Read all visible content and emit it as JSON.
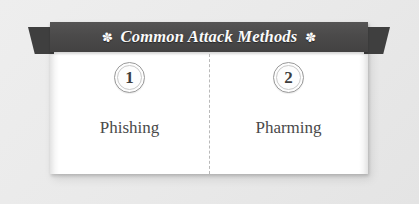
{
  "banner": {
    "title": "Common Attack Methods",
    "ornament_left": "✽",
    "ornament_right": "✽",
    "ornament_left_name": "fleuron-ornament-icon",
    "ornament_right_name": "fleuron-ornament-icon",
    "background_color": "#4a4a4a",
    "text_color": "#fbfbfb"
  },
  "card": {
    "background_color": "#ffffff",
    "canvas_color": "#ececec"
  },
  "divider": {
    "style": "dashed",
    "color": "#b9b9b9"
  },
  "columns": [
    {
      "number": "1",
      "label": "Phishing"
    },
    {
      "number": "2",
      "label": "Pharming"
    }
  ]
}
